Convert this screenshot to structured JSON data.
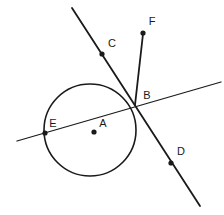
{
  "figure": {
    "background_color": "#ffffff",
    "stroke_color": "#1a1a1a",
    "width": 224,
    "height": 215
  },
  "chart_data": {
    "type": "diagram",
    "subtype": "euclidean-geometry",
    "title": "",
    "circle": {
      "label": "circle-A",
      "center_label": "A",
      "cx": 90,
      "cy": 130,
      "r": 46,
      "stroke_width": 1.6
    },
    "points": [
      {
        "id": "A",
        "label": "A",
        "x": 94,
        "y": 132,
        "label_x": 103,
        "label_y": 124,
        "dot_r": 2.6,
        "role": "center"
      },
      {
        "id": "B",
        "label": "B",
        "x": 135,
        "y": 105,
        "label_x": 147,
        "label_y": 96,
        "dot_r": 0,
        "role": "intersection"
      },
      {
        "id": "C",
        "label": "C",
        "x": 102,
        "y": 54,
        "label_x": 112,
        "label_y": 44,
        "dot_r": 2.6,
        "role": "line-marker"
      },
      {
        "id": "D",
        "label": "D",
        "x": 171,
        "y": 163,
        "label_x": 181,
        "label_y": 152,
        "dot_r": 2.6,
        "role": "line-marker"
      },
      {
        "id": "E",
        "label": "E",
        "x": 45,
        "y": 133,
        "label_x": 53,
        "label_y": 124,
        "dot_r": 2.6,
        "role": "intersection"
      },
      {
        "id": "F",
        "label": "F",
        "x": 143,
        "y": 33,
        "label_x": 152,
        "label_y": 22,
        "dot_r": 2.6,
        "role": "endpoint"
      }
    ],
    "lines": [
      {
        "id": "secant-EB",
        "label": "secant line through E and B",
        "x1": 17,
        "y1": 141,
        "x2": 221,
        "y2": 82,
        "stroke_width": 1.3
      },
      {
        "id": "line-CBD",
        "label": "line through C, B and D",
        "x1": 72,
        "y1": 8,
        "x2": 200,
        "y2": 206,
        "stroke_width": 1.8
      },
      {
        "id": "ray-BF",
        "label": "ray from B to F",
        "x1": 135,
        "y1": 105,
        "x2": 143,
        "y2": 34,
        "stroke_width": 1.8
      }
    ],
    "labels": [
      "A",
      "B",
      "C",
      "D",
      "E",
      "F"
    ]
  }
}
